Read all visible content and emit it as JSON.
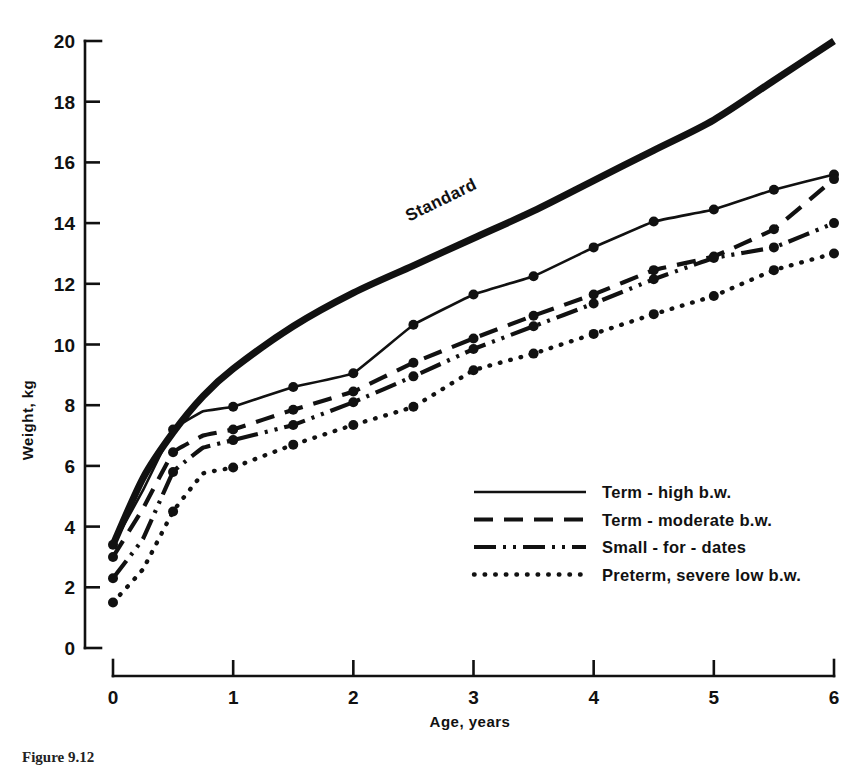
{
  "figure": {
    "caption": "Figure 9.12",
    "annotation_standard": "Standard"
  },
  "axes": {
    "x_title": "Age, years",
    "y_title": "Weight, kg",
    "x_ticks": [
      "0",
      "1",
      "2",
      "3",
      "4",
      "5",
      "6"
    ],
    "y_ticks": [
      "0",
      "2",
      "4",
      "6",
      "8",
      "10",
      "12",
      "14",
      "16",
      "18",
      "20"
    ]
  },
  "legend": {
    "items": [
      {
        "label": "Term - high b.w.",
        "style": "solid"
      },
      {
        "label": "Term - moderate b.w.",
        "style": "dashed"
      },
      {
        "label": "Small - for - dates",
        "style": "dash-dot-dot"
      },
      {
        "label": "Preterm, severe low b.w.",
        "style": "dotted"
      }
    ]
  },
  "chart_data": {
    "type": "line",
    "title": "",
    "xlabel": "Age, years",
    "ylabel": "Weight, kg",
    "xlim": [
      0,
      6
    ],
    "ylim": [
      0,
      20
    ],
    "grid": false,
    "legend_position": "center-right-inside",
    "annotations": [
      {
        "text": "Standard",
        "x": 2.75,
        "y": 14.6,
        "rotation": -26
      }
    ],
    "x": [
      0,
      0.25,
      0.5,
      0.75,
      1,
      1.5,
      2,
      2.5,
      3,
      3.5,
      4,
      4.5,
      5,
      5.5,
      6
    ],
    "series": [
      {
        "name": "Standard",
        "style": "thick-solid",
        "markers": false,
        "values": [
          3.4,
          5.6,
          7.1,
          8.3,
          9.2,
          10.6,
          11.7,
          12.6,
          13.5,
          14.4,
          15.4,
          16.4,
          17.4,
          18.7,
          20.0
        ]
      },
      {
        "name": "Term - high b.w.",
        "style": "solid",
        "markers": true,
        "values": [
          3.4,
          5.2,
          7.2,
          7.8,
          7.95,
          8.6,
          9.05,
          10.65,
          11.65,
          12.25,
          13.2,
          14.05,
          14.45,
          15.1,
          15.6
        ]
      },
      {
        "name": "Term - moderate b.w.",
        "style": "dashed",
        "markers": true,
        "values": [
          3.0,
          4.6,
          6.45,
          7.0,
          7.2,
          7.85,
          8.45,
          9.4,
          10.2,
          10.95,
          11.65,
          12.45,
          12.9,
          13.8,
          15.45
        ]
      },
      {
        "name": "Small - for - dates",
        "style": "dash-dot-dot",
        "markers": true,
        "values": [
          2.3,
          3.6,
          5.8,
          6.6,
          6.85,
          7.35,
          8.1,
          8.95,
          9.85,
          10.6,
          11.35,
          12.15,
          12.85,
          13.2,
          14.0
        ]
      },
      {
        "name": "Preterm, severe low b.w.",
        "style": "dotted",
        "markers": true,
        "values": [
          1.5,
          2.6,
          4.5,
          5.75,
          5.95,
          6.7,
          7.35,
          7.95,
          9.15,
          9.7,
          10.35,
          11.0,
          11.6,
          12.45,
          13.0
        ]
      }
    ]
  },
  "colors": {
    "ink": "#111111",
    "background": "#ffffff"
  }
}
